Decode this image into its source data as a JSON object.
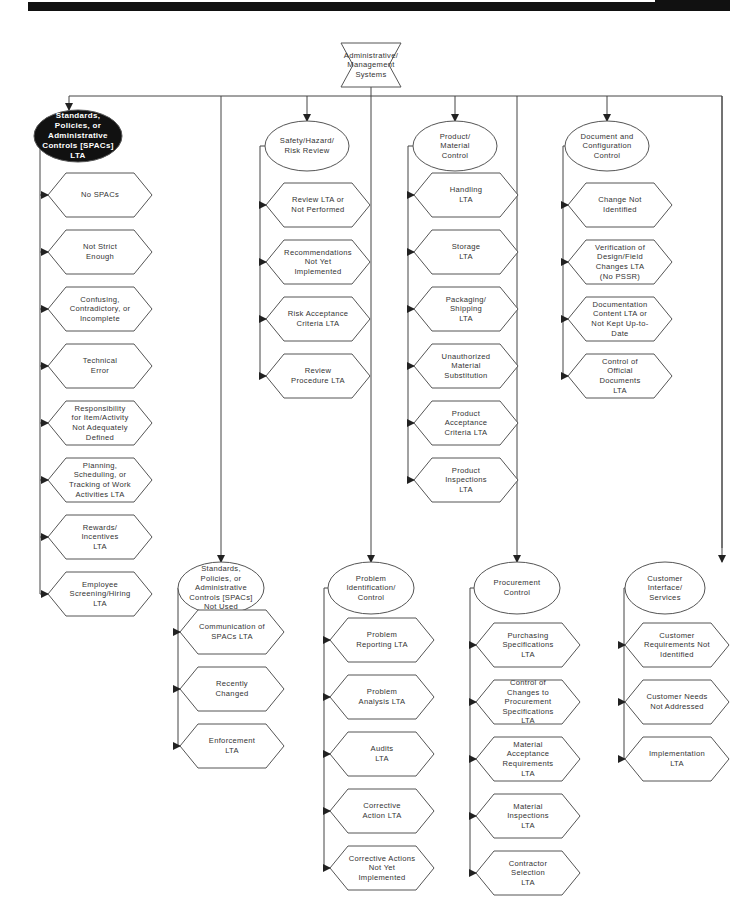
{
  "header": {
    "bar_color": "#111111"
  },
  "root": {
    "label": "Administrative/\nManagement\nSystems",
    "shape": "bowtie"
  },
  "branches": [
    {
      "id": "spacs-lta",
      "label": "Standards,\nPolicies, or\nAdministrative\nControls [SPACs]\nLTA",
      "shape": "ellipse",
      "highlighted": true,
      "children": [
        "No SPACs",
        "Not Strict\nEnough",
        "Confusing,\nContradictory, or\nIncomplete",
        "Technical\nError",
        "Responsibility\nfor Item/Activity\nNot Adequately\nDefined",
        "Planning,\nScheduling, or\nTracking of Work\nActivities LTA",
        "Rewards/\nIncentives\nLTA",
        "Employee\nScreening/Hiring\nLTA"
      ]
    },
    {
      "id": "safety",
      "label": "Safety/Hazard/\nRisk Review",
      "shape": "ellipse",
      "children": [
        "Review LTA or\nNot Performed",
        "Recommendations\nNot Yet\nImplemented",
        "Risk Acceptance\nCriteria LTA",
        "Review\nProcedure LTA"
      ]
    },
    {
      "id": "product",
      "label": "Product/\nMaterial\nControl",
      "shape": "ellipse",
      "children": [
        "Handling\nLTA",
        "Storage\nLTA",
        "Packaging/\nShipping\nLTA",
        "Unauthorized\nMaterial\nSubstitution",
        "Product\nAcceptance\nCriteria LTA",
        "Product\nInspections\nLTA"
      ]
    },
    {
      "id": "document",
      "label": "Document and\nConfiguration\nControl",
      "shape": "ellipse",
      "children": [
        "Change Not\nIdentified",
        "Verification of\nDesign/Field\nChanges LTA\n(No PSSR)",
        "Documentation\nContent LTA or\nNot Kept Up-to-\nDate",
        "Control of\nOfficial\nDocuments\nLTA"
      ]
    },
    {
      "id": "spacs-not-used",
      "label": "Standards,\nPolicies, or\nAdministrative\nControls [SPACs]\nNot Used",
      "shape": "ellipse",
      "children": [
        "Communication of\nSPACs LTA",
        "Recently\nChanged",
        "Enforcement\nLTA"
      ]
    },
    {
      "id": "problem",
      "label": "Problem\nIdentification/\nControl",
      "shape": "ellipse",
      "children": [
        "Problem\nReporting LTA",
        "Problem\nAnalysis LTA",
        "Audits\nLTA",
        "Corrective\nAction LTA",
        "Corrective Actions\nNot Yet\nImplemented"
      ]
    },
    {
      "id": "procurement",
      "label": "Procurement\nControl",
      "shape": "ellipse",
      "children": [
        "Purchasing\nSpecifications\nLTA",
        "Control of\nChanges to\nProcurement\nSpecifications\nLTA",
        "Material\nAcceptance\nRequirements\nLTA",
        "Material\nInspections\nLTA",
        "Contractor\nSelection\nLTA"
      ]
    },
    {
      "id": "customer",
      "label": "Customer\nInterface/\nServices",
      "shape": "ellipse",
      "children": [
        "Customer\nRequirements Not\nIdentified",
        "Customer Needs\nNot Addressed",
        "Implementation\nLTA"
      ]
    }
  ]
}
